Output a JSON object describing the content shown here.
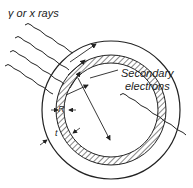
{
  "diagram": {
    "title": "γ or x rays",
    "labels": {
      "secondary_line1": "Secondary",
      "secondary_line2": "electrons",
      "wall_thickness": "R",
      "gap": "t"
    },
    "elements": [
      "incident radiation (wavy lines)",
      "outer chamber wall",
      "hatched inner wall",
      "secondary electron tracks (arrows)"
    ],
    "colors": {
      "line": "#222222",
      "background": "#ffffff"
    }
  }
}
